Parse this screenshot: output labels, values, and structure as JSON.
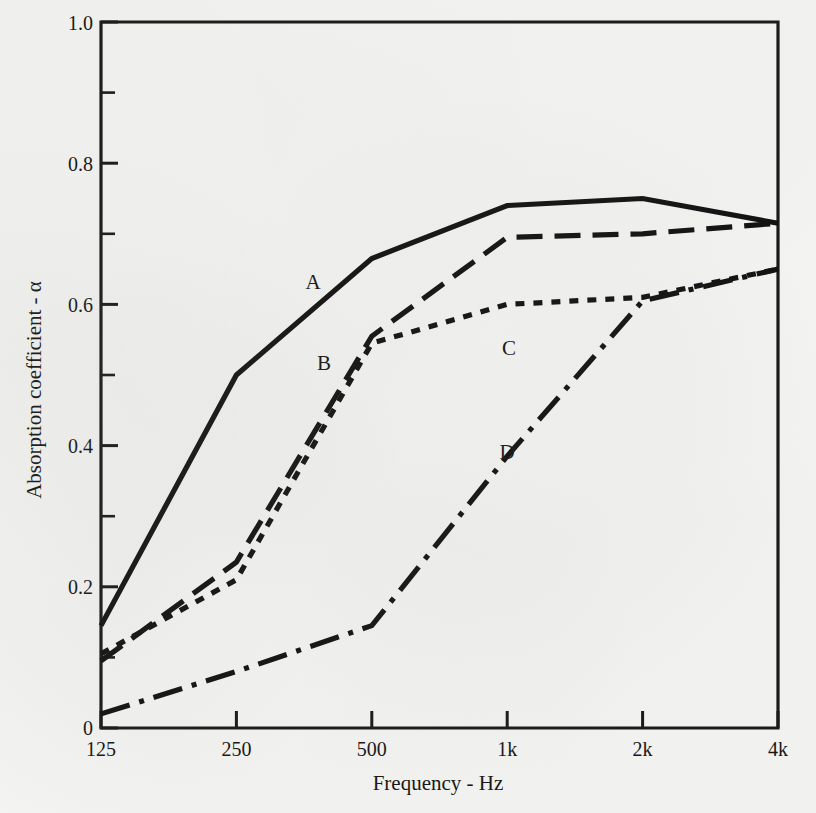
{
  "chart_data": {
    "type": "line",
    "title": "",
    "xlabel": "Frequency - Hz",
    "ylabel": "Absorption coefficient - α",
    "x_tick_labels": [
      "125",
      "250",
      "500",
      "1k",
      "2k",
      "4k"
    ],
    "x_tick_values": [
      125,
      250,
      500,
      1000,
      2000,
      4000
    ],
    "x_scale": "log2-octave",
    "xlim": [
      125,
      4000
    ],
    "y_tick_labels": [
      "0",
      "0.2",
      "0.4",
      "0.6",
      "0.8",
      "1.0"
    ],
    "y_tick_values": [
      0,
      0.2,
      0.4,
      0.6,
      0.8,
      1.0
    ],
    "y_minor_tick_values": [
      0.1,
      0.3,
      0.5,
      0.7,
      0.9
    ],
    "ylim": [
      0,
      1.0
    ],
    "grid": false,
    "legend": "inline-curve-labels",
    "categories": [
      "125",
      "250",
      "500",
      "1k",
      "2k",
      "4k"
    ],
    "series": [
      {
        "name": "A",
        "style": "solid",
        "label_x": 313,
        "label_y": 289,
        "values": [
          0.145,
          0.5,
          0.665,
          0.74,
          0.75,
          0.715
        ]
      },
      {
        "name": "B",
        "style": "long-dash",
        "label_x": 324,
        "label_y": 370,
        "values": [
          0.095,
          0.235,
          0.555,
          0.695,
          0.7,
          0.715
        ]
      },
      {
        "name": "C",
        "style": "short-dash",
        "label_x": 509,
        "label_y": 355,
        "values": [
          0.105,
          0.21,
          0.545,
          0.6,
          0.61,
          0.65
        ]
      },
      {
        "name": "D",
        "style": "dash-dot",
        "label_x": 507,
        "label_y": 459,
        "values": [
          0.02,
          0.08,
          0.145,
          0.385,
          0.605,
          0.65
        ]
      }
    ]
  },
  "axes": {
    "x_title": "Frequency - Hz",
    "y_title": "Absorption coefficient - α"
  },
  "colors": {
    "ink": "#0d0d0d",
    "paper": "#f6f6f4"
  }
}
